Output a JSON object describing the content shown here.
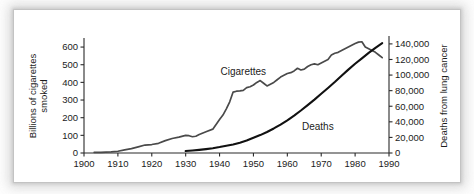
{
  "figure": {
    "background": "#ffffff",
    "plate_color": "#ffffff",
    "frame_style": "soft-grey-vignette"
  },
  "chart_data": {
    "type": "line",
    "title": "",
    "subtitle": "",
    "xlabel": "",
    "ylabel": "Billions of cigarettes smoked",
    "y2label": "Deaths from lung cancer",
    "xlim": [
      1900,
      1990
    ],
    "ylim": [
      0,
      640
    ],
    "y2lim": [
      0,
      145000
    ],
    "grid": false,
    "legend_position": "inline-annotation",
    "xticks": [
      1900,
      1910,
      1920,
      1930,
      1940,
      1950,
      1960,
      1970,
      1980,
      1990
    ],
    "xticklabels": [
      "1900",
      "1910",
      "1920",
      "1930",
      "1940",
      "1950",
      "1960",
      "1970",
      "1980",
      "1990"
    ],
    "yticks": [
      0,
      100,
      200,
      300,
      400,
      500,
      600
    ],
    "yticklabels": [
      "0",
      "100",
      "200",
      "300",
      "400",
      "500",
      "600"
    ],
    "y2ticks": [
      0,
      20000,
      40000,
      60000,
      80000,
      100000,
      120000,
      140000
    ],
    "y2ticklabels": [
      "0",
      "20,000",
      "40,000",
      "60,000",
      "80,000",
      "100,000",
      "120,000",
      "140,000"
    ],
    "annotations": [
      {
        "text": "Cigarettes",
        "x": 1947,
        "y": 440
      },
      {
        "text": "Deaths",
        "x": 1969,
        "y": 130
      }
    ],
    "series": [
      {
        "name": "Cigarettes",
        "axis": "left",
        "units": "billions of cigarettes smoked",
        "color": "#4a4a4a",
        "x": [
          1903,
          1905,
          1908,
          1910,
          1912,
          1914,
          1916,
          1918,
          1920,
          1922,
          1924,
          1926,
          1928,
          1930,
          1931,
          1932,
          1933,
          1934,
          1936,
          1938,
          1940,
          1941,
          1942,
          1943,
          1944,
          1945,
          1946,
          1947,
          1948,
          1949,
          1950,
          1951,
          1952,
          1953,
          1954,
          1955,
          1956,
          1957,
          1958,
          1959,
          1960,
          1961,
          1962,
          1963,
          1964,
          1965,
          1966,
          1967,
          1968,
          1969,
          1970,
          1971,
          1972,
          1973,
          1974,
          1975,
          1976,
          1977,
          1978,
          1979,
          1980,
          1981,
          1982,
          1983,
          1984,
          1985,
          1986,
          1987,
          1988
        ],
        "y": [
          3,
          4,
          6,
          10,
          18,
          25,
          35,
          45,
          48,
          55,
          70,
          82,
          90,
          100,
          98,
          92,
          95,
          105,
          120,
          135,
          190,
          215,
          250,
          290,
          345,
          350,
          352,
          355,
          370,
          375,
          385,
          400,
          410,
          395,
          380,
          390,
          400,
          415,
          430,
          440,
          450,
          455,
          465,
          480,
          470,
          475,
          490,
          500,
          505,
          500,
          510,
          520,
          530,
          555,
          565,
          570,
          580,
          590,
          600,
          610,
          620,
          628,
          630,
          600,
          590,
          580,
          570,
          555,
          540
        ]
      },
      {
        "name": "Deaths",
        "axis": "right",
        "units": "deaths from lung cancer",
        "color": "#111111",
        "x": [
          1930,
          1932,
          1934,
          1936,
          1938,
          1940,
          1942,
          1944,
          1946,
          1948,
          1950,
          1952,
          1954,
          1956,
          1958,
          1960,
          1962,
          1964,
          1966,
          1968,
          1970,
          1972,
          1974,
          1976,
          1978,
          1980,
          1982,
          1984,
          1986,
          1988
        ],
        "y": [
          2500,
          3200,
          4000,
          5000,
          6200,
          7600,
          9200,
          11000,
          13200,
          16000,
          19500,
          23000,
          27000,
          31500,
          36500,
          42000,
          48000,
          54500,
          61500,
          68500,
          76000,
          83500,
          91000,
          99000,
          107000,
          114500,
          121500,
          128500,
          135000,
          141000
        ]
      }
    ]
  }
}
